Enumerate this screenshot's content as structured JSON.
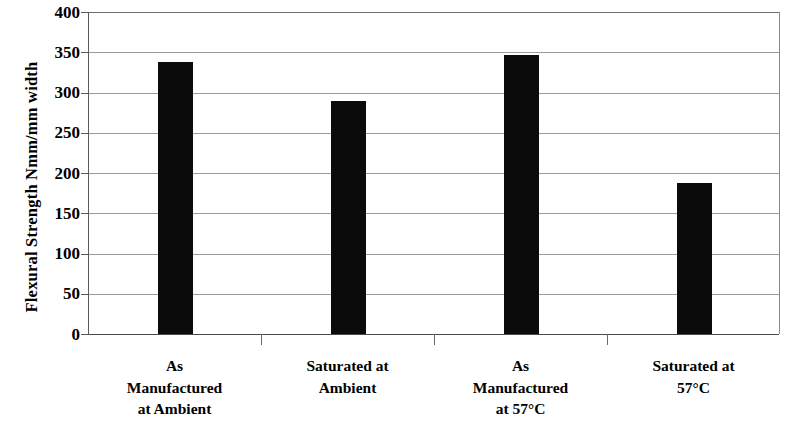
{
  "chart_data": {
    "type": "bar",
    "title": "",
    "subtitle": "",
    "xlabel": "",
    "ylabel": "Flexural Strength Nmm/mm width",
    "ylim": [
      0,
      400
    ],
    "ytick_step": 50,
    "yticks": [
      400,
      350,
      300,
      250,
      200,
      150,
      100,
      50,
      0
    ],
    "ytick_labels": [
      "400",
      "350",
      "300",
      "250",
      "200",
      "150",
      "100",
      "50",
      "0"
    ],
    "categories": [
      "As Manufactured at Ambient",
      "Saturated at Ambient",
      "As Manufactured at 57°C",
      "Saturated at 57°C"
    ],
    "category_label_lines": [
      [
        "As",
        "Manufactured",
        "at Ambient"
      ],
      [
        "Saturated at",
        "Ambient"
      ],
      [
        "As",
        "Manufactured",
        "at 57°C"
      ],
      [
        "Saturated at",
        "57°C"
      ]
    ],
    "values": [
      338,
      290,
      346,
      187
    ],
    "series": [
      {
        "name": "Flexural Strength",
        "values": [
          338,
          290,
          346,
          187
        ]
      }
    ],
    "grid": true,
    "grid_axis": "y",
    "legend": "none",
    "bar_color": "#0b0b0b",
    "grid_color": "#9b9b9b",
    "axis_color": "#4a4a4a",
    "background_color": "#ffffff"
  }
}
